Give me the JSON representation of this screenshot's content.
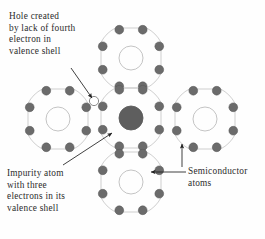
{
  "figure": {
    "background_color": "#fefefe"
  },
  "colors": {
    "electron_fill": "#6b6b6b",
    "electron_stroke": "#555555",
    "impurity_nucleus_fill": "#5e5e5e",
    "shell_stroke": "#c9c9c9",
    "nucleus_stroke": "#bdbdbd",
    "hole_stroke": "#8a8a8a",
    "text_color": "#2b2b2b",
    "arrow_color": "#1f1f1f"
  },
  "labels": {
    "hole": {
      "name": "hole-label",
      "lines": [
        "Hole created",
        "by lack of fourth",
        "electron in",
        "valence shell"
      ]
    },
    "impurity": {
      "name": "impurity-label",
      "lines": [
        "Impurity atom",
        "with three",
        "electrons in its",
        "valence shell"
      ]
    },
    "semiconductor": {
      "name": "semiconductor-label",
      "lines": [
        "Semiconductor",
        "atoms"
      ]
    }
  },
  "chart_data": {
    "type": "diagram",
    "atoms": [
      {
        "id": "atom-top",
        "role": "semiconductor",
        "cx": 131,
        "cy": 58,
        "nucleus_radius": 12,
        "nucleus_filled": false,
        "shell_radius": 30,
        "electron_count": 8
      },
      {
        "id": "atom-left",
        "role": "semiconductor",
        "cx": 58,
        "cy": 119,
        "nucleus_radius": 12,
        "nucleus_filled": false,
        "shell_radius": 30,
        "electron_count": 8
      },
      {
        "id": "atom-center-impurity",
        "role": "impurity",
        "cx": 131,
        "cy": 118,
        "nucleus_radius": 12,
        "nucleus_filled": true,
        "shell_radius": 30,
        "electron_count": 8
      },
      {
        "id": "atom-right",
        "role": "semiconductor",
        "cx": 205,
        "cy": 119,
        "nucleus_radius": 12,
        "nucleus_filled": false,
        "shell_radius": 30,
        "electron_count": 8
      },
      {
        "id": "atom-bottom",
        "role": "semiconductor",
        "cx": 131,
        "cy": 182,
        "nucleus_radius": 12,
        "nucleus_filled": false,
        "shell_radius": 30,
        "electron_count": 8
      }
    ],
    "hole": {
      "id": "valence-hole",
      "cx": 94,
      "cy": 101,
      "radius": 4.6,
      "filled": false,
      "description": "missing fourth valence electron"
    },
    "arrows": [
      {
        "id": "arrow-hole",
        "from_label": "hole",
        "x1": 71,
        "y1": 68,
        "x2": 92,
        "y2": 98
      },
      {
        "id": "arrow-impurity",
        "from_label": "impurity",
        "x1": 63,
        "y1": 165,
        "x2": 112,
        "y2": 133
      },
      {
        "id": "arrow-semiconductor-bottom",
        "from_label": "semiconductor",
        "x1": 186,
        "y1": 172,
        "x2": 151,
        "y2": 172
      },
      {
        "id": "arrow-semiconductor-right",
        "from_label": "semiconductor",
        "x1": 182,
        "y1": 167,
        "x2": 182,
        "y2": 144
      }
    ],
    "annotations": [
      {
        "id": "hole-label",
        "x": 9,
        "y": 11,
        "text": "Hole created by lack of fourth electron in valence shell"
      },
      {
        "id": "impurity-label",
        "x": 7,
        "y": 168,
        "text": "Impurity atom with three electrons in its valence shell"
      },
      {
        "id": "semiconductor-label",
        "x": 188,
        "y": 166,
        "text": "Semiconductor atoms"
      }
    ]
  }
}
